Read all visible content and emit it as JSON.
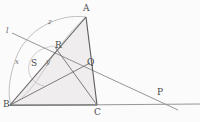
{
  "figure": {
    "type": "geometry-diagram",
    "width": 200,
    "height": 122,
    "background": "#fbfbfb",
    "stroke_color": "#6f6f6f",
    "arc_color": "#a9a9a9",
    "fill_color": "#efeded",
    "label_color": "#4a4a4a"
  },
  "points": {
    "A": {
      "label": "A",
      "x": 86,
      "y": 16
    },
    "B": {
      "label": "B",
      "x": 10,
      "y": 105
    },
    "C": {
      "label": "C",
      "x": 97,
      "y": 105
    },
    "P": {
      "label": "P",
      "x": 159,
      "y": 96
    },
    "Q": {
      "label": "Q",
      "x": 88,
      "y": 64
    },
    "R": {
      "label": "R",
      "x": 57,
      "y": 46
    },
    "S": {
      "label": "S",
      "x": 33,
      "y": 64
    }
  },
  "angle_marks": [
    {
      "label": "x",
      "x": 16,
      "y": 62
    },
    {
      "label": "y",
      "x": 47,
      "y": 62
    },
    {
      "label": "z",
      "x": 49,
      "y": 22
    }
  ],
  "line_labels": [
    {
      "label": "l",
      "x": 7,
      "y": 31
    }
  ],
  "segments": [
    {
      "name": "AB",
      "from": "A",
      "to": "B"
    },
    {
      "name": "AC",
      "from": "A",
      "to": "C"
    },
    {
      "name": "BC",
      "from": "B",
      "to": "C"
    },
    {
      "name": "BQ",
      "from": "B",
      "to": "Q"
    },
    {
      "name": "RC",
      "from": "R",
      "to": "C"
    },
    {
      "name": "transversal-l",
      "from": "l-left-end",
      "to": "P-right-end"
    }
  ],
  "arcs": [
    {
      "name": "circumcircle-through-A-R-B"
    },
    {
      "name": "small-arc-through-S-R"
    }
  ]
}
